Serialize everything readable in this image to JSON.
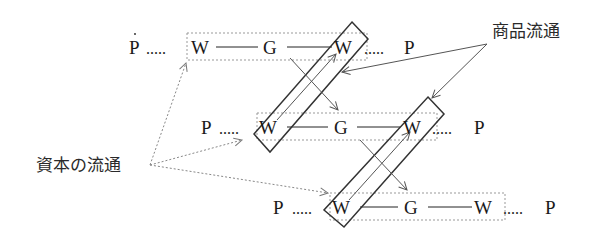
{
  "diagram": {
    "labels": {
      "commodity_circulation": "商品流通",
      "capital_circulation": "資本の流通"
    },
    "rows": [
      {
        "p_start": "P",
        "w1": "W",
        "g": "G",
        "w2": "W",
        "p_end": "P",
        "dots_left": ".....",
        "dots_right": "....."
      },
      {
        "p_start": "P",
        "w1": "W",
        "g": "G",
        "w2": "W",
        "p_end": "P",
        "dots_left": ".....",
        "dots_right": "....."
      },
      {
        "p_start": "P",
        "w1": "W",
        "g": "G",
        "w2": "W",
        "p_end": "P",
        "dots_left": ".....",
        "dots_right": "....."
      }
    ],
    "colors": {
      "text": "#1a1a1a",
      "box": "#333333",
      "arrow": "#555555",
      "dotted": "#888888"
    }
  }
}
